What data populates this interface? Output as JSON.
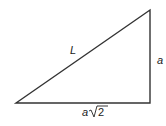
{
  "diagram": {
    "type": "right-triangle",
    "stroke_color": "#333333",
    "labels": {
      "hypotenuse": "L",
      "vertical_side": "a",
      "base_variable": "a",
      "base_radicand": "2"
    }
  }
}
